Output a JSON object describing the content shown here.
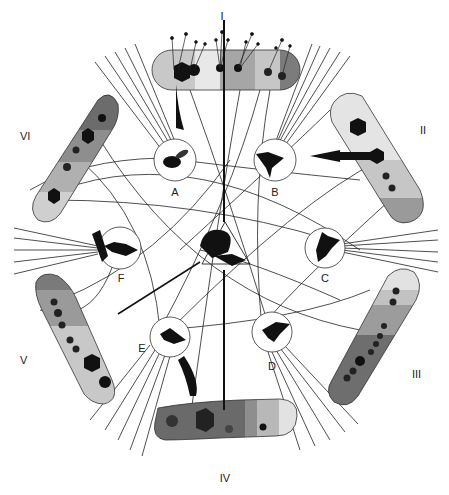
{
  "diagram": {
    "bands": [
      {
        "id": "I",
        "label": "I"
      },
      {
        "id": "II",
        "label": "II"
      },
      {
        "id": "III",
        "label": "III"
      },
      {
        "id": "IV",
        "label": "IV"
      },
      {
        "id": "V",
        "label": "V"
      },
      {
        "id": "VI",
        "label": "VI"
      }
    ],
    "animals": [
      {
        "id": "A",
        "label": "A",
        "kind": "bee"
      },
      {
        "id": "B",
        "label": "B",
        "kind": "hummingbird"
      },
      {
        "id": "C",
        "label": "C",
        "kind": "hawkmoth"
      },
      {
        "id": "D",
        "label": "D",
        "kind": "bat"
      },
      {
        "id": "E",
        "label": "E",
        "kind": "bird"
      },
      {
        "id": "F",
        "label": "F",
        "kind": "ant"
      }
    ],
    "center": {
      "kind": "leaf-cutter-ant"
    }
  },
  "colors": {
    "shade_light": "#e6e6e6",
    "shade_mid": "#bdbdbd",
    "shade_dark": "#8a8a8a",
    "shade_darkest": "#5e5e5e",
    "ink": "#111111"
  }
}
